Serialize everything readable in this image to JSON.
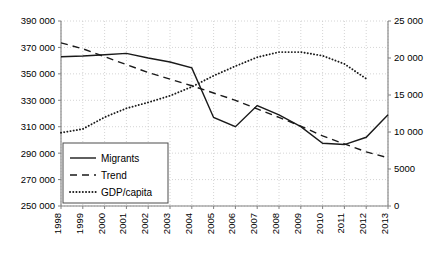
{
  "chart_data": {
    "type": "line",
    "title": "",
    "xlabel": "",
    "ylabel": "",
    "grid": true,
    "legend_position": "lower-left-inside",
    "categories": [
      "1998",
      "1999",
      "2000",
      "2001",
      "2002",
      "2003",
      "2004",
      "2005",
      "2006",
      "2007",
      "2008",
      "2009",
      "2010",
      "2011",
      "2012",
      "2013"
    ],
    "axes": {
      "x": {
        "tick_labels": [
          "1998",
          "1999",
          "2000",
          "2001",
          "2002",
          "2003",
          "2004",
          "2005",
          "2006",
          "2007",
          "2008",
          "2009",
          "2010",
          "2011",
          "2012",
          "2013"
        ],
        "tick_rotation_deg": 90
      },
      "y_left": {
        "label": "",
        "lim": [
          250000,
          390000
        ],
        "tick_step": 20000,
        "tick_labels": [
          "250 000",
          "270 000",
          "290 000",
          "310 000",
          "330 000",
          "350 000",
          "370 000",
          "390 000"
        ],
        "tick_values": [
          250000,
          270000,
          290000,
          310000,
          330000,
          350000,
          370000,
          390000
        ]
      },
      "y_right": {
        "label": "",
        "lim": [
          0,
          25000
        ],
        "tick_step": 5000,
        "tick_labels": [
          "0",
          "5000",
          "10 000",
          "15 000",
          "20 000",
          "25 000"
        ],
        "tick_values": [
          0,
          5000,
          10000,
          15000,
          20000,
          25000
        ]
      }
    },
    "series": [
      {
        "name": "Migrants",
        "axis": "left",
        "style": "solid",
        "color": "#1a1a1a",
        "x": [
          "1998",
          "1999",
          "2000",
          "2001",
          "2002",
          "2003",
          "2004",
          "2005",
          "2006",
          "2007",
          "2008",
          "2009",
          "2010",
          "2011",
          "2012",
          "2013"
        ],
        "values": [
          363000,
          363500,
          364500,
          365500,
          362000,
          359000,
          354500,
          317000,
          310000,
          326000,
          319000,
          310000,
          297500,
          296500,
          302000,
          319000
        ]
      },
      {
        "name": "Trend",
        "axis": "left",
        "style": "dashed",
        "color": "#1a1a1a",
        "x": [
          "1998",
          "1999",
          "2000",
          "2001",
          "2002",
          "2003",
          "2004",
          "2005",
          "2006",
          "2007",
          "2008",
          "2009",
          "2010",
          "2011",
          "2012",
          "2013"
        ],
        "values": [
          373500,
          369000,
          363000,
          357000,
          351000,
          346000,
          341000,
          335500,
          330000,
          323500,
          317000,
          310500,
          303000,
          297000,
          291000,
          286500
        ]
      },
      {
        "name": "GDP/capita",
        "axis": "right",
        "style": "dotted",
        "color": "#1a1a1a",
        "x": [
          "1998",
          "1999",
          "2000",
          "2001",
          "2002",
          "2003",
          "2004",
          "2005",
          "2006",
          "2007",
          "2008",
          "2009",
          "2010",
          "2011",
          "2012"
        ],
        "values": [
          9900,
          10400,
          12000,
          13200,
          14000,
          14900,
          16100,
          17600,
          18900,
          20100,
          20800,
          20800,
          20300,
          19200,
          17200
        ]
      }
    ]
  },
  "legend": {
    "entries": [
      {
        "label": "Migrants",
        "style": "solid"
      },
      {
        "label": "Trend",
        "style": "dashed"
      },
      {
        "label": "GDP/capita",
        "style": "dotted"
      }
    ]
  }
}
